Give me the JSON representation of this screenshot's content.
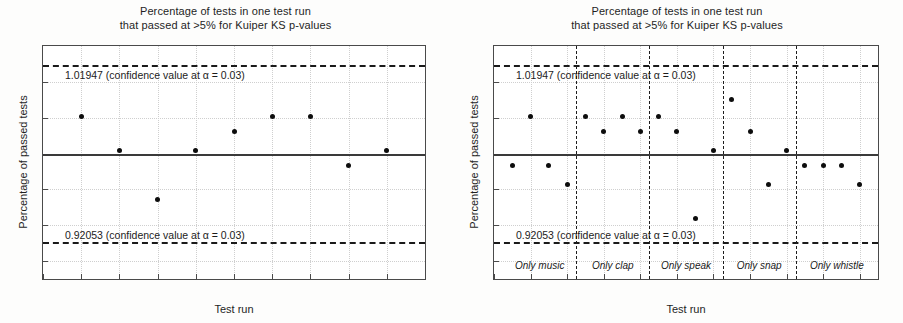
{
  "figure": {
    "title_line1": "Percentage of tests in one test run",
    "title_line2": "that passed at >5% for Kuiper KS p-values",
    "xlabel": "Test run",
    "ylabel": "Percentage of passed tests",
    "upper_confidence_label": "1.01947 (confidence value at α = 0.03)",
    "lower_confidence_label": "0.92053 (confidence value at α = 0.03)"
  },
  "chart_data": [
    {
      "type": "scatter",
      "title": "Percentage of tests in one test run\nthat passed at >5% for Kuiper KS p-values",
      "xlabel": "Test run",
      "ylabel": "Percentage of passed tests",
      "xlim": [
        0,
        10
      ],
      "ylim": [
        0.9,
        1.03
      ],
      "grid": true,
      "legend": "none",
      "xticks": [
        "0",
        "1",
        "2",
        "3",
        "4",
        "5",
        "6",
        "7",
        "8",
        "9",
        "10"
      ],
      "xtick_values": [
        0,
        1,
        2,
        3,
        4,
        5,
        6,
        7,
        8,
        9,
        10
      ],
      "yticks": [
        "0.91",
        "0.93",
        "0.95",
        "0.97",
        "0.99",
        "1.01"
      ],
      "ytick_values": [
        0.91,
        0.93,
        0.95,
        0.97,
        0.99,
        1.01
      ],
      "x": [
        1,
        2,
        3,
        4,
        5,
        6,
        7,
        8,
        9
      ],
      "values": [
        0.9905,
        0.9715,
        0.9442,
        0.9715,
        0.9822,
        0.9905,
        0.9905,
        0.9632,
        0.9715
      ],
      "annotations": [
        {
          "name": "upper-confidence",
          "y": 1.01947,
          "text": "1.01947 (confidence value at α = 0.03)",
          "style": "dashed"
        },
        {
          "name": "lower-confidence",
          "y": 0.92053,
          "text": "0.92053 (confidence value at α = 0.03)",
          "style": "dashed"
        },
        {
          "name": "mean-line",
          "y": 0.97,
          "text": "",
          "style": "solid"
        }
      ]
    },
    {
      "type": "scatter",
      "title": "Percentage of tests in one test run\nthat passed at >5% for Kuiper KS p-values",
      "xlabel": "Test run",
      "ylabel": "Percentage of passed tests",
      "xlim": [
        0,
        21
      ],
      "ylim": [
        0.9,
        1.03
      ],
      "grid": true,
      "legend": "none",
      "xticks": [
        "0",
        "2",
        "4",
        "6",
        "8",
        "10",
        "12",
        "14",
        "16",
        "18",
        "20"
      ],
      "xtick_values": [
        0,
        2,
        4,
        6,
        8,
        10,
        12,
        14,
        16,
        18,
        20
      ],
      "yticks": [
        "0.91",
        "0.93",
        "0.95",
        "0.97",
        "0.99",
        "1.01"
      ],
      "ytick_values": [
        0.91,
        0.93,
        0.95,
        0.97,
        0.99,
        1.01
      ],
      "x": [
        1,
        2,
        3,
        4,
        5,
        6,
        7,
        8,
        9,
        10,
        11,
        12,
        13,
        14,
        15,
        16,
        17,
        18,
        19,
        20
      ],
      "values": [
        0.9632,
        0.9905,
        0.9632,
        0.9525,
        0.9905,
        0.9822,
        0.9905,
        0.9822,
        0.9905,
        0.9822,
        0.934,
        0.9715,
        1.0,
        0.9822,
        0.9525,
        0.9715,
        0.9632,
        0.9632,
        0.9632,
        0.9525
      ],
      "groups": [
        {
          "label": "Only music",
          "from": 0.5,
          "to": 4.5,
          "center": 2.5
        },
        {
          "label": "Only clap",
          "from": 4.5,
          "to": 8.5,
          "center": 6.5
        },
        {
          "label": "Only speak",
          "from": 8.5,
          "to": 12.5,
          "center": 10.5
        },
        {
          "label": "Only snap",
          "from": 12.5,
          "to": 16.5,
          "center": 14.5
        },
        {
          "label": "Only whistle",
          "from": 16.5,
          "to": 21.0,
          "center": 18.75
        }
      ],
      "group_separators": [
        4.5,
        8.5,
        12.5,
        16.5
      ],
      "annotations": [
        {
          "name": "upper-confidence",
          "y": 1.01947,
          "text": "1.01947 (confidence value at α = 0.03)",
          "style": "dashed"
        },
        {
          "name": "lower-confidence",
          "y": 0.92053,
          "text": "0.92053 (confidence value at α = 0.03)",
          "style": "dashed"
        },
        {
          "name": "mean-line",
          "y": 0.97,
          "text": "",
          "style": "solid"
        }
      ]
    }
  ]
}
